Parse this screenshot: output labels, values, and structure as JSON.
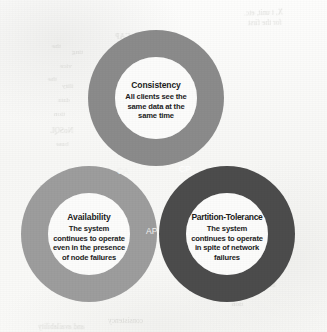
{
  "diagram": {
    "type": "venn",
    "circles": [
      {
        "id": "consistency",
        "title": "Consistency",
        "description": "All clients see the same data at the same time",
        "description_lines": [
          "All clients see the",
          "same data at the",
          "same time"
        ],
        "color": "#8b8b8b",
        "inner_color": "#fcfcfb",
        "position": "top"
      },
      {
        "id": "availability",
        "title": "Availability",
        "description": "The system continues to operate even in the presence of node failures",
        "description_lines": [
          "The system",
          "continues to operate",
          "even in the presence",
          "of node failures"
        ],
        "color": "#9d9d9d",
        "inner_color": "#fcfcfb",
        "position": "bottom-left"
      },
      {
        "id": "partition-tolerance",
        "title": "Partition-Tolerance",
        "description": "The system continues to operate in spite of network failures",
        "description_lines": [
          "The system",
          "continues to operate",
          "in spite of network",
          "failures"
        ],
        "color": "#4c4c4c",
        "inner_color": "#fcfcfb",
        "position": "bottom-right"
      }
    ],
    "intersections": [
      {
        "id": "ca",
        "label": "CA",
        "between": [
          "consistency",
          "availability"
        ],
        "text_color": "#f2f2f0"
      },
      {
        "id": "cp",
        "label": "CP",
        "between": [
          "consistency",
          "partition-tolerance"
        ],
        "text_color": "#ffffff"
      },
      {
        "id": "ap",
        "label": "AP",
        "between": [
          "availability",
          "partition-tolerance"
        ],
        "text_color": "#f4f4f2"
      }
    ]
  },
  "background": {
    "page_color": "#fbfbfa",
    "bleed_through": [
      {
        "text": "X, t unit, etc.",
        "left": 244,
        "top": 8,
        "size": 7.5,
        "rotate": -1.5
      },
      {
        "text": "for the first",
        "left": 248,
        "top": 18,
        "size": 7.5,
        "rotate": -1.0
      },
      {
        "text": "CAP",
        "left": 115,
        "top": 32,
        "size": 8,
        "rotate": -1.0
      },
      {
        "text": "the",
        "left": 52,
        "top": 42,
        "size": 7,
        "rotate": 0.5
      },
      {
        "text": "ting",
        "left": 72,
        "top": 48,
        "size": 7,
        "rotate": 0.5
      },
      {
        "text": "vice",
        "left": 60,
        "top": 62,
        "size": 7,
        "rotate": 0.5
      },
      {
        "text": "the",
        "left": 48,
        "top": 75,
        "size": 7,
        "rotate": 0.5
      },
      {
        "text": "ility",
        "left": 62,
        "top": 82,
        "size": 7,
        "rotate": 0.5
      },
      {
        "text": "data",
        "left": 58,
        "top": 96,
        "size": 7,
        "rotate": 0.5
      },
      {
        "text": "tion",
        "left": 54,
        "top": 110,
        "size": 7,
        "rotate": 0.5
      },
      {
        "text": "NoSQL",
        "left": 50,
        "top": 126,
        "size": 7.5,
        "rotate": 0.5
      },
      {
        "text": "base",
        "left": 56,
        "top": 140,
        "size": 7,
        "rotate": 0.5
      },
      {
        "text": "by",
        "left": 40,
        "top": 182,
        "size": 7,
        "rotate": 0.5
      },
      {
        "text": "tion",
        "left": 232,
        "top": 300,
        "size": 7,
        "rotate": 0.5
      },
      {
        "text": "issing",
        "left": 258,
        "top": 280,
        "size": 7.5,
        "rotate": -0.5
      },
      {
        "text": "consistency",
        "left": 108,
        "top": 316,
        "size": 7.5,
        "rotate": 0.5
      },
      {
        "text": "and availability",
        "left": 38,
        "top": 322,
        "size": 7.5,
        "rotate": 0.5
      }
    ]
  }
}
